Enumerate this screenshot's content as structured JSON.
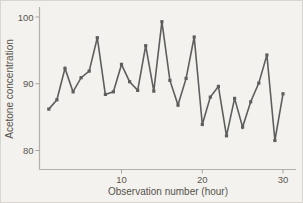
{
  "figure": {
    "bg_color": "#f4f2ee",
    "border_color": "#d9d6d0"
  },
  "chart_data": {
    "type": "line",
    "title": "",
    "xlabel": "Observation number (hour)",
    "ylabel": "Acetone concentration",
    "x": [
      1,
      2,
      3,
      4,
      5,
      6,
      7,
      8,
      9,
      10,
      11,
      12,
      13,
      14,
      15,
      16,
      17,
      18,
      19,
      20,
      21,
      22,
      23,
      24,
      25,
      26,
      27,
      28,
      29,
      30
    ],
    "values": [
      86.2,
      87.6,
      92.3,
      88.8,
      90.9,
      91.9,
      96.9,
      88.4,
      88.8,
      92.9,
      90.3,
      89.0,
      95.7,
      88.9,
      99.3,
      90.5,
      86.8,
      90.8,
      97.0,
      83.9,
      88.0,
      89.6,
      82.2,
      87.8,
      83.5,
      87.3,
      90.1,
      94.3,
      81.5,
      88.5
    ],
    "xticks": [
      10,
      20,
      30
    ],
    "yticks": [
      80,
      90,
      100
    ],
    "xlim": [
      0,
      31.5
    ],
    "ylim": [
      77,
      101.5
    ],
    "grid": false,
    "legend": null,
    "marker": "square",
    "line_color": "#5e5e5e",
    "marker_color": "#5e5e5e",
    "axis_color": "#b3b0aa",
    "tick_color": "#a8a59f"
  }
}
